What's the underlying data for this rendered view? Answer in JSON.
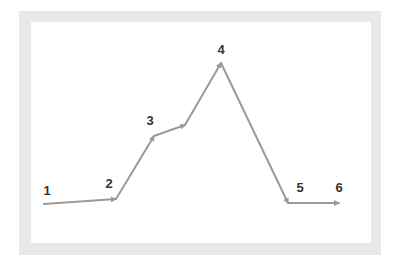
{
  "diagram": {
    "type": "path-with-arrows",
    "frame_color": "#e9e9e9",
    "background_color": "#ffffff",
    "line_color": "#9a9a9a",
    "label_color": "#333333",
    "points": [
      {
        "id": "1",
        "label": "1",
        "x": 44,
        "y": 204,
        "label_x": 47,
        "label_y": 190
      },
      {
        "id": "2",
        "label": "2",
        "x": 116,
        "y": 199,
        "label_x": 109,
        "label_y": 183
      },
      {
        "id": "3",
        "label": "3",
        "x": 154,
        "y": 136,
        "label_x": 150,
        "label_y": 120
      },
      {
        "id": "3b",
        "label": "",
        "x": 185,
        "y": 125
      },
      {
        "id": "4",
        "label": "4",
        "x": 221,
        "y": 63,
        "label_x": 221,
        "label_y": 49
      },
      {
        "id": "5",
        "label": "5",
        "x": 288,
        "y": 203,
        "label_x": 300,
        "label_y": 187
      },
      {
        "id": "6",
        "label": "6",
        "x": 339,
        "y": 203,
        "label_x": 339,
        "label_y": 187
      }
    ],
    "labels": {
      "p1": "1",
      "p2": "2",
      "p3": "3",
      "p4": "4",
      "p5": "5",
      "p6": "6"
    }
  }
}
